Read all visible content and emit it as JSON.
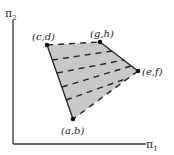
{
  "diagram": {
    "axes": {
      "x_label": "π",
      "x_sub": "1",
      "y_label": "π",
      "y_sub": "2"
    },
    "vertices": [
      {
        "id": "ab",
        "label": "(a,b)",
        "x": 73,
        "y": 119
      },
      {
        "id": "cd",
        "label": "(c,d)",
        "x": 47,
        "y": 45
      },
      {
        "id": "gh",
        "label": "(g,h)",
        "x": 100,
        "y": 42
      },
      {
        "id": "ef",
        "label": "(e,f)",
        "x": 138,
        "y": 71
      }
    ],
    "region_fill": "#c8c8c8",
    "edge_color": "#222222"
  }
}
